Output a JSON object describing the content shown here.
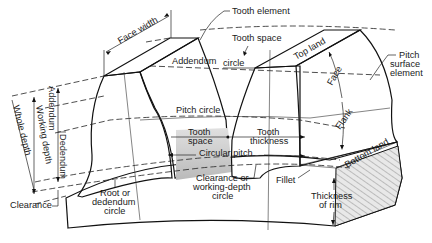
{
  "diagram": {
    "labels": {
      "tooth_element": "Tooth element",
      "face_width": "Face width",
      "tooth_space_top": "Tooth space",
      "addendum_circle_a": "Addendum",
      "addendum_circle_b": "circle",
      "top_land": "Top land",
      "pitch_surface_element_1": "Pitch",
      "pitch_surface_element_2": "surface",
      "pitch_surface_element_3": "element",
      "face": "Face",
      "flank": "Flank",
      "pitch_circle": "Pitch circle",
      "tooth_space_1": "Tooth",
      "tooth_space_2": "space",
      "tooth_thickness_1": "Tooth",
      "tooth_thickness_2": "thickness",
      "circular_pitch": "Circular pitch",
      "bottom_land": "Bottom land",
      "addendum": "Addendum",
      "dedendum": "Dedendum",
      "working_depth": "Working depth",
      "whole_depth": "Whole depth",
      "clearance": "Clearance",
      "root_circle_1": "Root or",
      "root_circle_2": "dedendum",
      "root_circle_3": "circle",
      "clearance_circle_1": "Clearance or",
      "clearance_circle_2": "working-depth",
      "clearance_circle_3": "circle",
      "fillet": "Fillet",
      "thickness_of_rim_1": "Thickness",
      "thickness_of_rim_2": "of rim"
    },
    "colors": {
      "background": "#ffffff",
      "tooth_dark": "#8a8a8a",
      "tooth_mid": "#a8a8a8",
      "tooth_light": "#d4d4d4",
      "rim": "#b5b5b5",
      "line": "#1a1a1a"
    }
  }
}
